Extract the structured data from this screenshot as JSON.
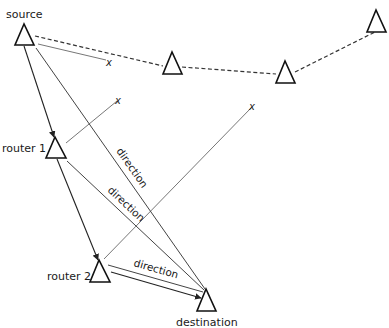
{
  "diagram": {
    "type": "network-routing",
    "nodes": [
      {
        "id": "source",
        "label": "source"
      },
      {
        "id": "router1",
        "label": "router 1"
      },
      {
        "id": "router2",
        "label": "router 2"
      },
      {
        "id": "destination",
        "label": "destination"
      },
      {
        "id": "relay1",
        "label": ""
      },
      {
        "id": "relay2",
        "label": ""
      },
      {
        "id": "relay3",
        "label": ""
      }
    ],
    "edges": [
      {
        "from": "source",
        "to": "router1",
        "style": "solid",
        "arrow": true
      },
      {
        "from": "router1",
        "to": "router2",
        "style": "solid",
        "arrow": true
      },
      {
        "from": "router2",
        "to": "destination",
        "style": "solid",
        "arrow": true
      },
      {
        "from": "source",
        "to": "destination",
        "style": "solid",
        "label": "direction"
      },
      {
        "from": "router1",
        "to": "destination",
        "style": "solid",
        "label": "direction"
      },
      {
        "from": "router2",
        "to": "destination",
        "style": "solid",
        "label": "direction"
      },
      {
        "from": "source",
        "to": "relay1",
        "style": "dashed"
      },
      {
        "from": "relay1",
        "to": "relay2",
        "style": "dashed"
      },
      {
        "from": "relay2",
        "to": "relay3",
        "style": "dashed"
      }
    ],
    "blocked_paths": [
      {
        "from": "source",
        "mark": "x"
      },
      {
        "from": "router1",
        "mark": "x"
      },
      {
        "from": "router2",
        "mark": "x"
      }
    ],
    "labels": {
      "source": "source",
      "router1": "router 1",
      "router2": "router 2",
      "destination": "destination",
      "direction": "direction",
      "x": "x"
    }
  }
}
